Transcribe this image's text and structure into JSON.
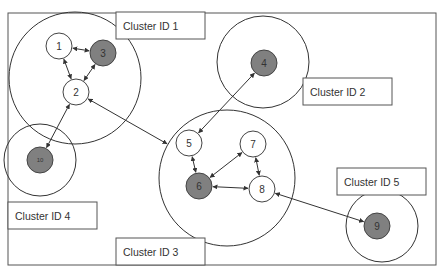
{
  "diagram": {
    "type": "cluster-network",
    "colors": {
      "stroke": "#333333",
      "node_white": "#ffffff",
      "node_grey": "#808080",
      "frame": "#555555"
    },
    "clusters": [
      {
        "id": "c1",
        "label": "Cluster ID 1",
        "cx": 75,
        "cy": 78,
        "r": 66,
        "label_box": {
          "x": 116,
          "y": 12,
          "w": 89,
          "h": 27
        }
      },
      {
        "id": "c2",
        "label": "Cluster ID 2",
        "cx": 263,
        "cy": 62,
        "r": 46,
        "label_box": {
          "x": 303,
          "y": 78,
          "w": 89,
          "h": 27
        }
      },
      {
        "id": "c3",
        "label": "Cluster ID 3",
        "cx": 227,
        "cy": 178,
        "r": 68,
        "label_box": {
          "x": 116,
          "y": 238,
          "w": 89,
          "h": 27
        }
      },
      {
        "id": "c4",
        "label": "Cluster ID 4",
        "cx": 40,
        "cy": 160,
        "r": 36,
        "label_box": {
          "x": 8,
          "y": 202,
          "w": 89,
          "h": 27
        }
      },
      {
        "id": "c5",
        "label": "Cluster ID 5",
        "cx": 382,
        "cy": 226,
        "r": 36,
        "label_box": {
          "x": 337,
          "y": 168,
          "w": 89,
          "h": 27
        }
      }
    ],
    "nodes": [
      {
        "id": "1",
        "label": "1",
        "cx": 59,
        "cy": 46,
        "r": 13,
        "fill": "white"
      },
      {
        "id": "2",
        "label": "2",
        "cx": 76,
        "cy": 92,
        "r": 13,
        "fill": "white"
      },
      {
        "id": "3",
        "label": "3",
        "cx": 103,
        "cy": 53,
        "r": 13,
        "fill": "grey"
      },
      {
        "id": "4",
        "label": "4",
        "cx": 264,
        "cy": 63,
        "r": 13,
        "fill": "grey"
      },
      {
        "id": "5",
        "label": "5",
        "cx": 189,
        "cy": 143,
        "r": 13,
        "fill": "white"
      },
      {
        "id": "6",
        "label": "6",
        "cx": 199,
        "cy": 186,
        "r": 13,
        "fill": "grey"
      },
      {
        "id": "7",
        "label": "7",
        "cx": 253,
        "cy": 144,
        "r": 13,
        "fill": "white"
      },
      {
        "id": "8",
        "label": "8",
        "cx": 262,
        "cy": 189,
        "r": 13,
        "fill": "white"
      },
      {
        "id": "9",
        "label": "9",
        "cx": 377,
        "cy": 226,
        "r": 13,
        "fill": "grey"
      },
      {
        "id": "10",
        "label": "10",
        "cx": 40,
        "cy": 160,
        "r": 13,
        "fill": "grey",
        "small": true
      }
    ],
    "edges": [
      {
        "from": "1",
        "to": "3",
        "direction": "both"
      },
      {
        "from": "1",
        "to": "2",
        "direction": "both"
      },
      {
        "from": "3",
        "to": "2",
        "direction": "both"
      },
      {
        "from": "2",
        "to": "10",
        "direction": "both"
      },
      {
        "from": "2",
        "to": "c3",
        "direction": "both"
      },
      {
        "from": "4",
        "to": "5",
        "direction": "both"
      },
      {
        "from": "5",
        "to": "6",
        "direction": "both"
      },
      {
        "from": "6",
        "to": "7",
        "direction": "both"
      },
      {
        "from": "6",
        "to": "8",
        "direction": "both"
      },
      {
        "from": "7",
        "to": "8",
        "direction": "both"
      },
      {
        "from": "8",
        "to": "9",
        "direction": "both"
      }
    ]
  }
}
